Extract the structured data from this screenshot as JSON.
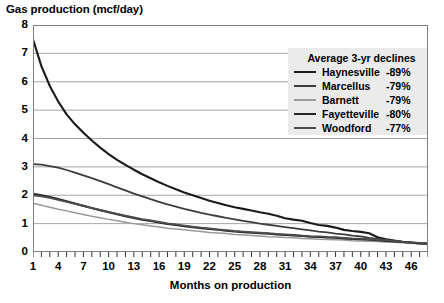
{
  "chart_data": {
    "type": "line",
    "title": "Gas production (mcf/day)",
    "xlabel": "Months on production",
    "ylabel": "",
    "xlim": [
      1,
      48
    ],
    "ylim": [
      0,
      8
    ],
    "grid": "horizontal",
    "legend_position": "top-right",
    "legend_title": "Average 3-yr declines",
    "x_tick_labels": [
      "1",
      "4",
      "7",
      "10",
      "13",
      "16",
      "19",
      "22",
      "25",
      "28",
      "31",
      "34",
      "37",
      "40",
      "43",
      "46"
    ],
    "x_tick_values": [
      1,
      4,
      7,
      10,
      13,
      16,
      19,
      22,
      25,
      28,
      31,
      34,
      37,
      40,
      43,
      46
    ],
    "x_minor_tick_step": 1,
    "y_tick_labels": [
      "0",
      "1",
      "2",
      "3",
      "4",
      "5",
      "6",
      "7",
      "8"
    ],
    "y_tick_values": [
      0,
      1,
      2,
      3,
      4,
      5,
      6,
      7,
      8
    ],
    "x": [
      1,
      2,
      3,
      4,
      5,
      6,
      7,
      8,
      9,
      10,
      11,
      12,
      13,
      14,
      15,
      16,
      17,
      18,
      19,
      20,
      21,
      22,
      23,
      24,
      25,
      26,
      27,
      28,
      29,
      30,
      31,
      32,
      33,
      34,
      35,
      36,
      37,
      38,
      39,
      40,
      41,
      42,
      43,
      44,
      45,
      46,
      47,
      48
    ],
    "series": [
      {
        "name": "Haynesville",
        "decline": "-89%",
        "color": "#1a1a1a",
        "width": 2.1,
        "values": [
          7.5,
          6.55,
          5.85,
          5.3,
          4.85,
          4.5,
          4.2,
          3.93,
          3.68,
          3.45,
          3.25,
          3.07,
          2.9,
          2.74,
          2.6,
          2.46,
          2.33,
          2.21,
          2.1,
          2.0,
          1.9,
          1.81,
          1.73,
          1.65,
          1.58,
          1.52,
          1.46,
          1.4,
          1.35,
          1.28,
          1.19,
          1.14,
          1.1,
          1.02,
          0.95,
          0.92,
          0.86,
          0.78,
          0.74,
          0.71,
          0.66,
          0.52,
          0.45,
          0.4,
          0.36,
          0.33,
          0.31,
          0.3
        ]
      },
      {
        "name": "Marcellus",
        "decline": "-79%",
        "color": "#3d3d3d",
        "width": 1.8,
        "values": [
          3.1,
          3.08,
          3.03,
          2.97,
          2.89,
          2.8,
          2.7,
          2.6,
          2.5,
          2.39,
          2.28,
          2.17,
          2.06,
          1.96,
          1.86,
          1.77,
          1.68,
          1.6,
          1.52,
          1.45,
          1.38,
          1.32,
          1.26,
          1.2,
          1.15,
          1.1,
          1.05,
          1.0,
          0.96,
          0.92,
          0.88,
          0.84,
          0.8,
          0.76,
          0.72,
          0.69,
          0.65,
          0.62,
          0.58,
          0.55,
          0.5,
          0.46,
          0.42,
          0.38,
          0.35,
          0.32,
          0.3,
          0.28
        ]
      },
      {
        "name": "Barnett",
        "decline": "-79%",
        "color": "#999999",
        "width": 1.5,
        "values": [
          1.72,
          1.65,
          1.58,
          1.51,
          1.45,
          1.38,
          1.32,
          1.26,
          1.21,
          1.15,
          1.1,
          1.05,
          1.0,
          0.96,
          0.92,
          0.88,
          0.84,
          0.81,
          0.78,
          0.75,
          0.72,
          0.69,
          0.67,
          0.65,
          0.62,
          0.6,
          0.58,
          0.56,
          0.54,
          0.53,
          0.51,
          0.5,
          0.48,
          0.47,
          0.45,
          0.44,
          0.43,
          0.42,
          0.4,
          0.39,
          0.38,
          0.37,
          0.35,
          0.34,
          0.33,
          0.31,
          0.3,
          0.28
        ]
      },
      {
        "name": "Fayetteville",
        "decline": "-80%",
        "color": "#262626",
        "width": 2.0,
        "values": [
          2.05,
          2.0,
          1.94,
          1.87,
          1.79,
          1.71,
          1.63,
          1.55,
          1.47,
          1.4,
          1.33,
          1.26,
          1.2,
          1.14,
          1.09,
          1.04,
          0.99,
          0.95,
          0.91,
          0.87,
          0.84,
          0.81,
          0.78,
          0.75,
          0.72,
          0.7,
          0.68,
          0.66,
          0.64,
          0.62,
          0.6,
          0.58,
          0.56,
          0.54,
          0.53,
          0.51,
          0.5,
          0.48,
          0.46,
          0.45,
          0.43,
          0.41,
          0.39,
          0.37,
          0.35,
          0.33,
          0.31,
          0.29
        ]
      },
      {
        "name": "Woodford",
        "decline": "-77%",
        "color": "#4d4d4d",
        "width": 1.8,
        "values": [
          2.0,
          1.96,
          1.91,
          1.84,
          1.77,
          1.7,
          1.62,
          1.55,
          1.48,
          1.41,
          1.34,
          1.28,
          1.22,
          1.16,
          1.11,
          1.06,
          1.01,
          0.97,
          0.93,
          0.89,
          0.86,
          0.83,
          0.8,
          0.77,
          0.74,
          0.72,
          0.7,
          0.68,
          0.66,
          0.64,
          0.62,
          0.6,
          0.58,
          0.56,
          0.55,
          0.53,
          0.52,
          0.5,
          0.48,
          0.47,
          0.45,
          0.43,
          0.41,
          0.39,
          0.36,
          0.34,
          0.32,
          0.3
        ]
      }
    ]
  },
  "style": {
    "plot_border_color": "#808080",
    "gridline_color": "#a6a6a6",
    "legend_bg": "#ebebeb",
    "text_color": "#000000",
    "background": "#ffffff"
  }
}
